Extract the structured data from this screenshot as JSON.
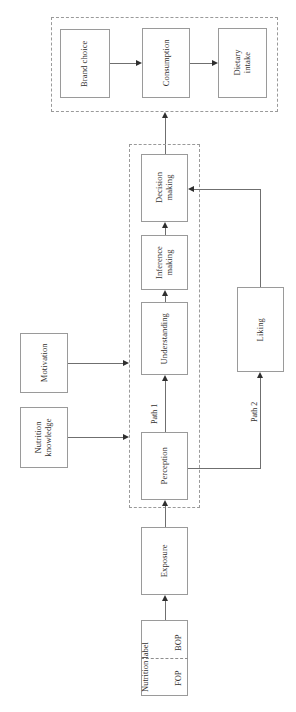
{
  "diagram": {
    "orientation": "rotated-90",
    "colors": {
      "box_border": "#9a9a9a",
      "dashed_border": "#9a9a9a",
      "line": "#6f6f6f",
      "arrow_head": "#2f2f2f",
      "text": "#33312f",
      "background": "#ffffff"
    },
    "groups": {
      "outcome_group": {
        "name": "outcome-dashed-group"
      },
      "processing_group": {
        "name": "processing-dashed-group"
      }
    },
    "nodes": {
      "brand_choice": "Brand choice",
      "consumption": "Consumption",
      "dietary_intake": "Dietary intake",
      "decision_making": "Decision making",
      "inference_making": "Inference making",
      "understanding": "Understanding",
      "perception": "Perception",
      "liking": "Liking",
      "motivation": "Motivation",
      "nutrition_knowledge": "Nutrition knowledge",
      "exposure": "Exposure",
      "nutrition_label": "Nutrition label",
      "fop": "FOP",
      "bop": "BOP"
    },
    "labels": {
      "path_1": "Path 1",
      "path_2": "Path 2"
    },
    "edges": [
      {
        "from": "Nutrition label",
        "to": "Exposure"
      },
      {
        "from": "Exposure",
        "to": "Perception"
      },
      {
        "from": "Perception",
        "to": "Understanding",
        "label": "Path 1"
      },
      {
        "from": "Understanding",
        "to": "Inference making"
      },
      {
        "from": "Inference making",
        "to": "Decision making"
      },
      {
        "from": "Perception",
        "to": "Liking",
        "label": "Path 2"
      },
      {
        "from": "Liking",
        "to": "Decision making"
      },
      {
        "from": "Decision making",
        "to": "Consumption"
      },
      {
        "from": "Brand choice",
        "to": "Consumption"
      },
      {
        "from": "Consumption",
        "to": "Dietary intake"
      },
      {
        "from": "Motivation",
        "to": "Understanding"
      },
      {
        "from": "Nutrition knowledge",
        "to": "Perception"
      }
    ]
  }
}
